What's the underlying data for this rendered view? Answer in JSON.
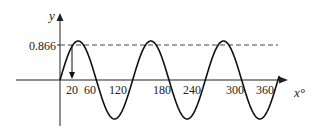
{
  "chart_data": {
    "type": "line",
    "title": "",
    "function": "y = sin(3x)",
    "xlabel": "x°",
    "ylabel": "y",
    "x_ticks": [
      20,
      60,
      120,
      180,
      240,
      300,
      360
    ],
    "x_tick_labels": [
      "20",
      "60",
      "120",
      "180",
      "240",
      "300",
      "360"
    ],
    "y_tick_labels": [
      "0.866"
    ],
    "xlim": [
      0,
      360
    ],
    "ylim": [
      -1,
      1
    ],
    "reference_line": {
      "y": 0.866,
      "style": "dashed",
      "label": "0.866"
    },
    "annotation": {
      "type": "arrow",
      "from": [
        20,
        0.866
      ],
      "to": [
        20,
        0
      ],
      "label": "20"
    },
    "series": [
      {
        "name": "sin(3x)",
        "x": [
          0,
          20,
          30,
          60,
          90,
          120,
          150,
          180,
          210,
          240,
          270,
          300,
          330,
          360
        ],
        "values": [
          0,
          0.866,
          1,
          0,
          -1,
          0,
          1,
          0,
          -1,
          0,
          1,
          0,
          -1,
          0
        ]
      }
    ],
    "grid": false,
    "legend": null
  },
  "axes": {
    "x_label": "x°",
    "y_label": "y"
  },
  "labels": {
    "ref": "0.866",
    "t20": "20",
    "t60": "60",
    "t120": "120",
    "t180": "180",
    "t240": "240",
    "t300": "300",
    "t360": "360"
  }
}
